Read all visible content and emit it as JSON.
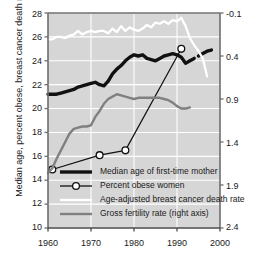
{
  "axes": {
    "left_label": "Median age, percent obese, breast cancer death rate",
    "right_label": "Gross fertility rate",
    "left_ticks": [
      "28",
      "26",
      "24",
      "22",
      "20",
      "18",
      "16",
      "14",
      "12",
      "10"
    ],
    "right_ticks": [
      "-0.1",
      "0.4",
      "0.9",
      "1.4",
      "1.9",
      "2.4"
    ],
    "x_ticks": [
      "1960",
      "1970",
      "1980",
      "1990",
      "2000"
    ]
  },
  "legend": {
    "items": [
      {
        "label": "Median age of first-time mother",
        "key": "thick-black-line",
        "color": "#111111"
      },
      {
        "label": "Percent obese women",
        "key": "thin-line-open-circle",
        "color": "#111111"
      },
      {
        "label": "Age-adjusted breast cancer death rate",
        "key": "white-line",
        "color": "#ffffff"
      },
      {
        "label": "Gross fertility rate (right axis)",
        "key": "gray-line",
        "color": "#808080"
      }
    ]
  },
  "chart_data": {
    "type": "line",
    "title": "",
    "xlabel": "",
    "ylabel": "Median age, percent obese, breast cancer death rate",
    "y2label": "Gross fertility rate",
    "xlim": [
      1960,
      2000
    ],
    "ylim": [
      10,
      28
    ],
    "y2lim": [
      2.4,
      -0.1
    ],
    "y2_inverted": true,
    "grid": true,
    "legend_position": "inside-bottom-left",
    "background": "#d6d6d6",
    "gridline_color": "#ffffff",
    "series": [
      {
        "name": "Median age of first-time mother",
        "color": "#111111",
        "style": "thick-solid",
        "axis": "left",
        "x": [
          1960,
          1961,
          1962,
          1963,
          1964,
          1965,
          1966,
          1967,
          1968,
          1969,
          1970,
          1971,
          1972,
          1973,
          1974,
          1975,
          1976,
          1977,
          1978,
          1979,
          1980,
          1981,
          1982,
          1983,
          1984,
          1985,
          1986,
          1987,
          1988,
          1989,
          1990,
          1991,
          1992,
          1993,
          1994
        ],
        "y": [
          21.2,
          21.2,
          21.2,
          21.3,
          21.4,
          21.5,
          21.6,
          21.8,
          21.9,
          22.0,
          22.1,
          22.2,
          22.0,
          21.9,
          22.3,
          22.9,
          23.3,
          23.6,
          24.0,
          24.3,
          24.5,
          24.4,
          24.5,
          24.2,
          24.1,
          24.0,
          24.2,
          24.4,
          24.5,
          24.6,
          24.5,
          24.3,
          23.8,
          24.0,
          24.2
        ]
      },
      {
        "name": "Median age of first-time mother (late segment)",
        "color": "#111111",
        "style": "thick-solid",
        "axis": "left",
        "x": [
          1995,
          1996,
          1997,
          1998
        ],
        "y": [
          24.4,
          24.6,
          24.8,
          24.9
        ]
      },
      {
        "name": "Percent obese women",
        "color": "#111111",
        "style": "thin-solid-markers",
        "marker": "open-circle",
        "axis": "left",
        "x": [
          1961,
          1972,
          1978,
          1991
        ],
        "y": [
          14.9,
          16.1,
          16.5,
          25.0
        ]
      },
      {
        "name": "Age-adjusted breast cancer death rate",
        "color": "#ffffff",
        "style": "solid",
        "axis": "left",
        "x": [
          1960,
          1961,
          1962,
          1963,
          1964,
          1965,
          1966,
          1967,
          1968,
          1969,
          1970,
          1971,
          1972,
          1973,
          1974,
          1975,
          1976,
          1977,
          1978,
          1979,
          1980,
          1981,
          1982,
          1983,
          1984,
          1985,
          1986,
          1987,
          1988,
          1989,
          1990,
          1991,
          1992,
          1993,
          1994,
          1995,
          1996,
          1997
        ],
        "y": [
          25.8,
          25.8,
          26.0,
          26.0,
          25.9,
          26.1,
          26.2,
          26.5,
          26.2,
          26.4,
          26.5,
          26.4,
          26.5,
          26.5,
          26.3,
          26.7,
          26.4,
          26.9,
          26.5,
          26.8,
          26.6,
          26.5,
          26.7,
          27.0,
          26.8,
          27.2,
          27.1,
          27.3,
          27.1,
          27.4,
          27.3,
          27.6,
          26.9,
          25.9,
          25.3,
          24.8,
          24.2,
          22.7
        ]
      },
      {
        "name": "Gross fertility rate (right axis)",
        "color": "#808080",
        "style": "solid",
        "axis": "right",
        "x": [
          1960,
          1961,
          1962,
          1963,
          1964,
          1965,
          1966,
          1967,
          1968,
          1969,
          1970,
          1971,
          1972,
          1973,
          1974,
          1975,
          1976,
          1977,
          1978,
          1979,
          1980,
          1981,
          1982,
          1983,
          1984,
          1985,
          1986,
          1987,
          1988,
          1989,
          1990,
          1991,
          1992,
          1993
        ],
        "y_left_equiv": [
          14.6,
          15.0,
          15.8,
          16.5,
          17.2,
          17.9,
          18.3,
          18.4,
          18.5,
          18.5,
          18.6,
          19.3,
          19.8,
          20.4,
          20.8,
          21.0,
          21.2,
          21.1,
          21.0,
          20.9,
          20.8,
          20.9,
          20.9,
          20.9,
          20.9,
          20.9,
          20.9,
          20.8,
          20.7,
          20.5,
          20.2,
          20.0,
          20.0,
          20.1
        ]
      }
    ]
  }
}
